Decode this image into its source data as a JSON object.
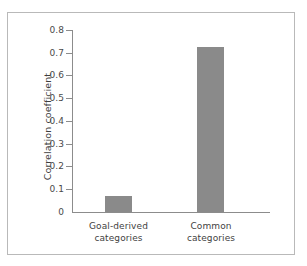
{
  "chart_data": {
    "type": "bar",
    "title": "",
    "subtitle": "",
    "xlabel": "",
    "ylabel": "Correlation coefficient",
    "categories": [
      "Goal-derived categories",
      "Common categories"
    ],
    "category_lines": [
      [
        "Goal-derived",
        "categories"
      ],
      [
        "Common",
        "categories"
      ]
    ],
    "values": [
      0.07,
      0.725
    ],
    "ylim": [
      0,
      0.8
    ],
    "ytick_labels": [
      "0.8",
      "0.7",
      "0.6",
      "0.5",
      "0.4",
      "0.3",
      "0.2",
      "0.1",
      "0"
    ],
    "ytick_values": [
      0.8,
      0.7,
      0.6,
      0.5,
      0.4,
      0.3,
      0.2,
      0.1,
      0
    ],
    "grid": false,
    "legend": false,
    "legend_position": "none",
    "annotations": []
  },
  "style": {
    "bar_color": "#8a8a8a",
    "axis_color": "#8c8c8c",
    "text_color": "#3f3f3f",
    "tick_label_color": "#4a4a4a",
    "frame_color": "#b9b9b9",
    "background": "#ffffff"
  }
}
